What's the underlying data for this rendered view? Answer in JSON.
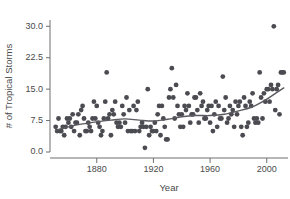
{
  "chart_data": {
    "type": "scatter",
    "title": "",
    "xlabel": "Year",
    "ylabel": "# of Tropical Storms",
    "xlim": [
      1847,
      2015
    ],
    "ylim": [
      0.0,
      31.5
    ],
    "grid": false,
    "legend": null,
    "xticks": [
      1880,
      1920,
      1960,
      2000
    ],
    "xtick_labels": [
      "1880",
      "1920",
      "1960",
      "2000"
    ],
    "yticks": [
      0.0,
      7.5,
      15.0,
      22.5,
      30.0
    ],
    "ytick_labels": [
      "0.0",
      "7.5",
      "15.0",
      "22.5",
      "30.0"
    ],
    "marker": {
      "shape": "circle",
      "color": "#4b4b52",
      "size": 2.4
    },
    "points": [
      {
        "x": 1851,
        "y": 6
      },
      {
        "x": 1852,
        "y": 5
      },
      {
        "x": 1853,
        "y": 8
      },
      {
        "x": 1854,
        "y": 5
      },
      {
        "x": 1855,
        "y": 5
      },
      {
        "x": 1856,
        "y": 6
      },
      {
        "x": 1857,
        "y": 4
      },
      {
        "x": 1858,
        "y": 6
      },
      {
        "x": 1859,
        "y": 8
      },
      {
        "x": 1860,
        "y": 7
      },
      {
        "x": 1861,
        "y": 8
      },
      {
        "x": 1862,
        "y": 6
      },
      {
        "x": 1863,
        "y": 9
      },
      {
        "x": 1864,
        "y": 5
      },
      {
        "x": 1865,
        "y": 7
      },
      {
        "x": 1866,
        "y": 7
      },
      {
        "x": 1867,
        "y": 9
      },
      {
        "x": 1868,
        "y": 4
      },
      {
        "x": 1869,
        "y": 10
      },
      {
        "x": 1870,
        "y": 11
      },
      {
        "x": 1871,
        "y": 8
      },
      {
        "x": 1872,
        "y": 5
      },
      {
        "x": 1873,
        "y": 5
      },
      {
        "x": 1874,
        "y": 7
      },
      {
        "x": 1875,
        "y": 6
      },
      {
        "x": 1876,
        "y": 5
      },
      {
        "x": 1877,
        "y": 8
      },
      {
        "x": 1878,
        "y": 12
      },
      {
        "x": 1879,
        "y": 8
      },
      {
        "x": 1880,
        "y": 11
      },
      {
        "x": 1881,
        "y": 7
      },
      {
        "x": 1882,
        "y": 6
      },
      {
        "x": 1883,
        "y": 4
      },
      {
        "x": 1884,
        "y": 5
      },
      {
        "x": 1885,
        "y": 8
      },
      {
        "x": 1886,
        "y": 12
      },
      {
        "x": 1887,
        "y": 19
      },
      {
        "x": 1888,
        "y": 8
      },
      {
        "x": 1889,
        "y": 9
      },
      {
        "x": 1890,
        "y": 4
      },
      {
        "x": 1891,
        "y": 10
      },
      {
        "x": 1892,
        "y": 9
      },
      {
        "x": 1893,
        "y": 12
      },
      {
        "x": 1894,
        "y": 7
      },
      {
        "x": 1895,
        "y": 6
      },
      {
        "x": 1896,
        "y": 7
      },
      {
        "x": 1897,
        "y": 6
      },
      {
        "x": 1898,
        "y": 11
      },
      {
        "x": 1899,
        "y": 9
      },
      {
        "x": 1900,
        "y": 7
      },
      {
        "x": 1901,
        "y": 13
      },
      {
        "x": 1902,
        "y": 5
      },
      {
        "x": 1903,
        "y": 10
      },
      {
        "x": 1904,
        "y": 5
      },
      {
        "x": 1905,
        "y": 5
      },
      {
        "x": 1906,
        "y": 11
      },
      {
        "x": 1907,
        "y": 5
      },
      {
        "x": 1908,
        "y": 10
      },
      {
        "x": 1909,
        "y": 12
      },
      {
        "x": 1910,
        "y": 5
      },
      {
        "x": 1911,
        "y": 6
      },
      {
        "x": 1912,
        "y": 7
      },
      {
        "x": 1913,
        "y": 6
      },
      {
        "x": 1914,
        "y": 1
      },
      {
        "x": 1915,
        "y": 6
      },
      {
        "x": 1916,
        "y": 15
      },
      {
        "x": 1917,
        "y": 4
      },
      {
        "x": 1918,
        "y": 6
      },
      {
        "x": 1919,
        "y": 5
      },
      {
        "x": 1920,
        "y": 5
      },
      {
        "x": 1921,
        "y": 7
      },
      {
        "x": 1922,
        "y": 5
      },
      {
        "x": 1923,
        "y": 9
      },
      {
        "x": 1924,
        "y": 11
      },
      {
        "x": 1925,
        "y": 4
      },
      {
        "x": 1926,
        "y": 11
      },
      {
        "x": 1927,
        "y": 8
      },
      {
        "x": 1928,
        "y": 6
      },
      {
        "x": 1929,
        "y": 3
      },
      {
        "x": 1930,
        "y": 3
      },
      {
        "x": 1931,
        "y": 13
      },
      {
        "x": 1932,
        "y": 15
      },
      {
        "x": 1933,
        "y": 20
      },
      {
        "x": 1934,
        "y": 13
      },
      {
        "x": 1935,
        "y": 8
      },
      {
        "x": 1936,
        "y": 16
      },
      {
        "x": 1937,
        "y": 11
      },
      {
        "x": 1938,
        "y": 9
      },
      {
        "x": 1939,
        "y": 6
      },
      {
        "x": 1940,
        "y": 9
      },
      {
        "x": 1941,
        "y": 6
      },
      {
        "x": 1942,
        "y": 11
      },
      {
        "x": 1943,
        "y": 10
      },
      {
        "x": 1944,
        "y": 14
      },
      {
        "x": 1945,
        "y": 11
      },
      {
        "x": 1946,
        "y": 7
      },
      {
        "x": 1947,
        "y": 9
      },
      {
        "x": 1948,
        "y": 9
      },
      {
        "x": 1949,
        "y": 13
      },
      {
        "x": 1950,
        "y": 13
      },
      {
        "x": 1951,
        "y": 10
      },
      {
        "x": 1952,
        "y": 7
      },
      {
        "x": 1953,
        "y": 14
      },
      {
        "x": 1954,
        "y": 11
      },
      {
        "x": 1955,
        "y": 12
      },
      {
        "x": 1956,
        "y": 8
      },
      {
        "x": 1957,
        "y": 8
      },
      {
        "x": 1958,
        "y": 10
      },
      {
        "x": 1959,
        "y": 11
      },
      {
        "x": 1960,
        "y": 7
      },
      {
        "x": 1961,
        "y": 11
      },
      {
        "x": 1962,
        "y": 5
      },
      {
        "x": 1963,
        "y": 9
      },
      {
        "x": 1964,
        "y": 12
      },
      {
        "x": 1965,
        "y": 6
      },
      {
        "x": 1966,
        "y": 11
      },
      {
        "x": 1967,
        "y": 8
      },
      {
        "x": 1968,
        "y": 8
      },
      {
        "x": 1969,
        "y": 18
      },
      {
        "x": 1970,
        "y": 10
      },
      {
        "x": 1971,
        "y": 13
      },
      {
        "x": 1972,
        "y": 7
      },
      {
        "x": 1973,
        "y": 8
      },
      {
        "x": 1974,
        "y": 11
      },
      {
        "x": 1975,
        "y": 9
      },
      {
        "x": 1976,
        "y": 10
      },
      {
        "x": 1977,
        "y": 6
      },
      {
        "x": 1978,
        "y": 12
      },
      {
        "x": 1979,
        "y": 9
      },
      {
        "x": 1980,
        "y": 11
      },
      {
        "x": 1981,
        "y": 12
      },
      {
        "x": 1982,
        "y": 6
      },
      {
        "x": 1983,
        "y": 4
      },
      {
        "x": 1984,
        "y": 13
      },
      {
        "x": 1985,
        "y": 11
      },
      {
        "x": 1986,
        "y": 6
      },
      {
        "x": 1987,
        "y": 7
      },
      {
        "x": 1988,
        "y": 12
      },
      {
        "x": 1989,
        "y": 11
      },
      {
        "x": 1990,
        "y": 14
      },
      {
        "x": 1991,
        "y": 8
      },
      {
        "x": 1992,
        "y": 7
      },
      {
        "x": 1993,
        "y": 8
      },
      {
        "x": 1994,
        "y": 7
      },
      {
        "x": 1995,
        "y": 19
      },
      {
        "x": 1996,
        "y": 13
      },
      {
        "x": 1997,
        "y": 8
      },
      {
        "x": 1998,
        "y": 14
      },
      {
        "x": 1999,
        "y": 12
      },
      {
        "x": 2000,
        "y": 15
      },
      {
        "x": 2001,
        "y": 15
      },
      {
        "x": 2002,
        "y": 12
      },
      {
        "x": 2003,
        "y": 16
      },
      {
        "x": 2004,
        "y": 15
      },
      {
        "x": 2005,
        "y": 30
      },
      {
        "x": 2006,
        "y": 10
      },
      {
        "x": 2007,
        "y": 15
      },
      {
        "x": 2008,
        "y": 16
      },
      {
        "x": 2009,
        "y": 9
      },
      {
        "x": 2010,
        "y": 19
      },
      {
        "x": 2011,
        "y": 19
      },
      {
        "x": 2012,
        "y": 19
      }
    ],
    "trend": {
      "label": "loess smooth",
      "color": "#5a5a60",
      "points": [
        {
          "x": 1851,
          "y": 5.2
        },
        {
          "x": 1860,
          "y": 6.0
        },
        {
          "x": 1870,
          "y": 6.7
        },
        {
          "x": 1880,
          "y": 7.2
        },
        {
          "x": 1890,
          "y": 7.6
        },
        {
          "x": 1900,
          "y": 7.9
        },
        {
          "x": 1910,
          "y": 7.6
        },
        {
          "x": 1920,
          "y": 7.4
        },
        {
          "x": 1930,
          "y": 7.8
        },
        {
          "x": 1940,
          "y": 8.4
        },
        {
          "x": 1950,
          "y": 8.7
        },
        {
          "x": 1960,
          "y": 8.7
        },
        {
          "x": 1970,
          "y": 9.0
        },
        {
          "x": 1980,
          "y": 9.8
        },
        {
          "x": 1990,
          "y": 10.8
        },
        {
          "x": 2000,
          "y": 12.6
        },
        {
          "x": 2008,
          "y": 14.4
        },
        {
          "x": 2012,
          "y": 15.3
        }
      ]
    }
  },
  "axes": {
    "x_title": "Year",
    "y_title": "# of Tropical Storms"
  }
}
